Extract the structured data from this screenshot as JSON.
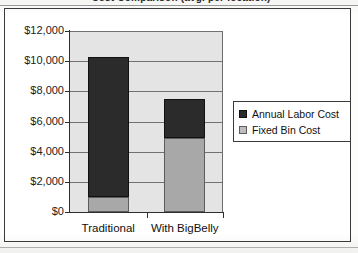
{
  "document": {
    "title_clipped": "Cost Comparison (avg. per location)",
    "paper_background": "#fdfdfc",
    "frame_color": "#3a3a3a"
  },
  "chart_data": {
    "type": "bar",
    "subtype": "stacked-column",
    "title": "Cost Comparison (avg. per location)",
    "xlabel": "",
    "ylabel": "",
    "categories": [
      "Traditional",
      "With BigBelly"
    ],
    "series": [
      {
        "name": "Fixed Bin Cost",
        "color": "#a8a8a8",
        "values": [
          1000,
          4900
        ]
      },
      {
        "name": "Annual Labor Cost",
        "color": "#2b2b2b",
        "values": [
          9300,
          2600
        ]
      }
    ],
    "stack_order": [
      "Fixed Bin Cost",
      "Annual Labor Cost"
    ],
    "totals": [
      10300,
      7500
    ],
    "ylim": [
      0,
      12000
    ],
    "ytick_step": 2000,
    "yticks": [
      0,
      2000,
      4000,
      6000,
      8000,
      10000,
      12000
    ],
    "ytick_labels": [
      "$0",
      "$2,000",
      "$4,000",
      "$6,000",
      "$8,000",
      "$10,000",
      "$12,000"
    ],
    "grid": true,
    "grid_axis": "y",
    "legend_position": "right",
    "plot_background": "#e4e4e4"
  },
  "axis": {
    "y_labels": [
      "$12,000",
      "$10,000",
      "$8,000",
      "$6,000",
      "$4,000",
      "$2,000",
      "$0"
    ],
    "x_labels": [
      "Traditional",
      "With BigBelly"
    ]
  },
  "legend": {
    "entries": [
      {
        "label": "Annual Labor Cost",
        "swatch": "dark"
      },
      {
        "label": "Fixed Bin Cost",
        "swatch": "light"
      }
    ]
  }
}
